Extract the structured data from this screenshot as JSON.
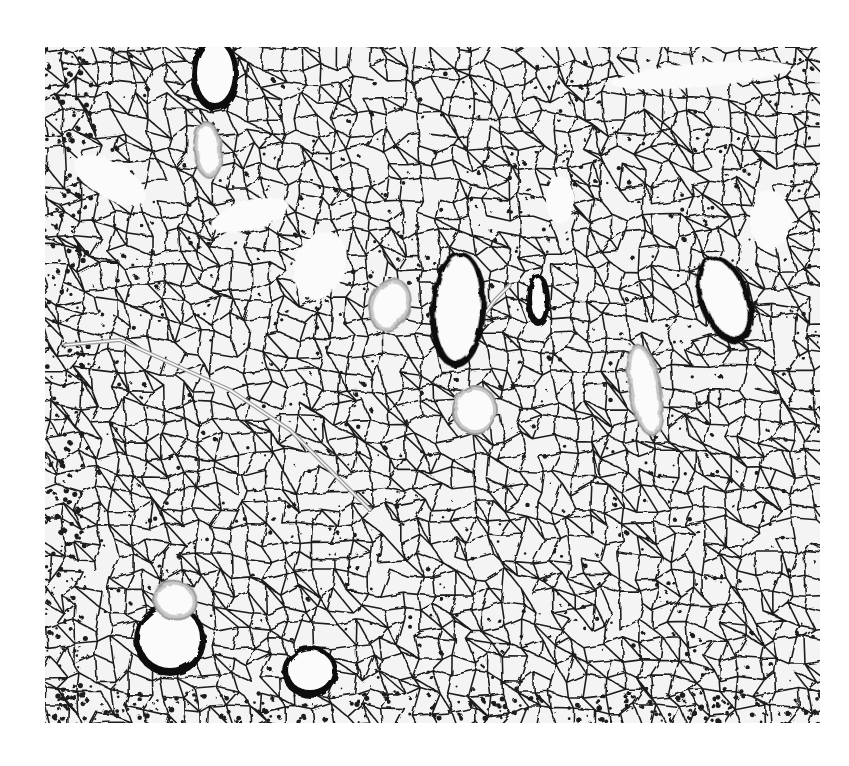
{
  "image": {
    "kind": "histology-micrograph",
    "subject": "lung tissue section",
    "colors": {
      "background": "#ffffff",
      "tissue_bg": "#f4f4f4",
      "septa": "#1e1e1e",
      "wall_dark": "#0d0d0d",
      "wall_light": "#9a9a9a",
      "lumen": "#fbfbfb"
    },
    "frame": {
      "x": 45,
      "y": 47,
      "width": 775,
      "height": 676
    },
    "structures": [
      {
        "name": "bronchiole-top-left",
        "type": "dark",
        "cx": 215,
        "cy": 75,
        "rx": 18,
        "ry": 30,
        "rot": 0
      },
      {
        "name": "vessel-top-left",
        "type": "light",
        "cx": 208,
        "cy": 150,
        "rx": 10,
        "ry": 24,
        "rot": -5
      },
      {
        "name": "bronchiole-center",
        "type": "dark",
        "cx": 458,
        "cy": 310,
        "rx": 22,
        "ry": 52,
        "rot": 3
      },
      {
        "name": "vessel-center-left",
        "type": "light",
        "cx": 390,
        "cy": 305,
        "rx": 16,
        "ry": 22,
        "rot": 20
      },
      {
        "name": "vessel-center-low",
        "type": "light",
        "cx": 475,
        "cy": 410,
        "rx": 18,
        "ry": 20,
        "rot": 0
      },
      {
        "name": "small-duct-center-right",
        "type": "dark",
        "cx": 538,
        "cy": 300,
        "rx": 6,
        "ry": 20,
        "rot": 0
      },
      {
        "name": "bronchiole-right",
        "type": "dark",
        "cx": 725,
        "cy": 300,
        "rx": 20,
        "ry": 40,
        "rot": -20
      },
      {
        "name": "vessel-right",
        "type": "light",
        "cx": 645,
        "cy": 390,
        "rx": 12,
        "ry": 42,
        "rot": -10
      },
      {
        "name": "bronchiole-bottom-left",
        "type": "dark",
        "cx": 170,
        "cy": 640,
        "rx": 30,
        "ry": 30,
        "rot": 0
      },
      {
        "name": "vessel-bottom-left",
        "type": "light",
        "cx": 175,
        "cy": 600,
        "rx": 18,
        "ry": 15,
        "rot": 20
      },
      {
        "name": "bronchiole-bottom-center",
        "type": "dark",
        "cx": 310,
        "cy": 672,
        "rx": 22,
        "ry": 20,
        "rot": 0
      }
    ],
    "airspaces": [
      {
        "cx": 110,
        "cy": 180,
        "rx": 40,
        "ry": 18,
        "rot": 30
      },
      {
        "cx": 250,
        "cy": 215,
        "rx": 40,
        "ry": 15,
        "rot": -15
      },
      {
        "cx": 320,
        "cy": 265,
        "rx": 25,
        "ry": 35,
        "rot": 20
      },
      {
        "cx": 700,
        "cy": 75,
        "rx": 90,
        "ry": 12,
        "rot": -5
      },
      {
        "cx": 770,
        "cy": 220,
        "rx": 20,
        "ry": 30,
        "rot": 0
      },
      {
        "cx": 560,
        "cy": 200,
        "rx": 14,
        "ry": 24,
        "rot": 0
      }
    ],
    "thin_vessels": [
      {
        "name": "septal-vessel-left",
        "points": "65,345 120,340 175,365 230,390 290,430 330,470 370,510"
      },
      {
        "name": "septal-vessel-center",
        "points": "480,320 495,300 510,285"
      }
    ]
  }
}
